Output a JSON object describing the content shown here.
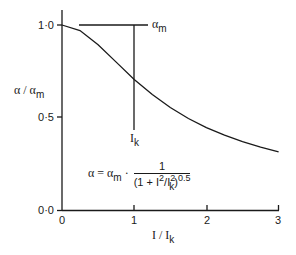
{
  "chart_data": {
    "type": "line",
    "title": "",
    "xlabel": "I / I_k",
    "ylabel": "α / α_m",
    "xlim": [
      0,
      3
    ],
    "ylim": [
      0,
      1
    ],
    "x_ticks": [
      "0",
      "1",
      "2",
      "3"
    ],
    "y_ticks": [
      "0·0",
      "0·5",
      "1·0"
    ],
    "grid": false,
    "legend": null,
    "series": [
      {
        "name": "α/α_m = 1/(1+I²/I_k²)^0.5",
        "x": [
          0,
          0.25,
          0.5,
          0.75,
          1.0,
          1.25,
          1.5,
          1.75,
          2.0,
          2.25,
          2.5,
          2.75,
          3.0
        ],
        "y": [
          1.0,
          0.97,
          0.894,
          0.8,
          0.707,
          0.625,
          0.555,
          0.496,
          0.447,
          0.406,
          0.371,
          0.342,
          0.316
        ]
      }
    ],
    "annotations": [
      {
        "text": "α_m",
        "description": "horizontal reference line at α/α_m = 1.0"
      },
      {
        "text": "I_k",
        "description": "vertical marker at I/I_k = 1"
      },
      {
        "text": "α = α_m · 1/(1 + I²/I_k²)^0.5",
        "description": "governing formula"
      }
    ]
  },
  "axes": {
    "y_label": {
      "main": "α / α",
      "sub": "m"
    },
    "x_label": {
      "main": "I / I",
      "sub": "k"
    },
    "y_ticks": [
      "0·0",
      "0·5",
      "1·0"
    ],
    "x_ticks": [
      "0",
      "1",
      "2",
      "3"
    ]
  },
  "annotations": {
    "alpha_m": {
      "main": "α",
      "sub": "m"
    },
    "i_k": {
      "main": "I",
      "sub": "k"
    }
  },
  "formula": {
    "lhs": "α = α",
    "lhs_sub": "m",
    "dot": "·",
    "numerator": "1",
    "den_open": "(1 + I",
    "den_sup1": "2",
    "den_mid": "/I",
    "den_sup2": "2",
    "den_sub2": "k",
    "den_close": ")",
    "den_exp": "0.5"
  }
}
